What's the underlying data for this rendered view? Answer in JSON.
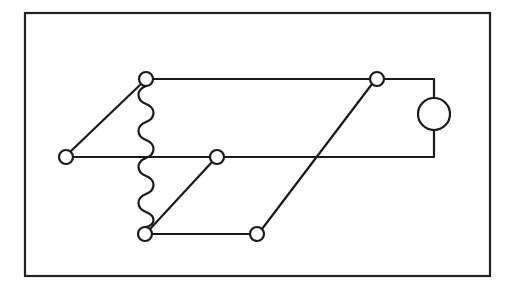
{
  "diagram": {
    "type": "circuit-schematic",
    "colors": {
      "line": "#1a1a1a",
      "background": "#ffffff"
    },
    "frame": {
      "x": 25,
      "y": 13,
      "width": 465,
      "height": 263
    },
    "nodes": [
      {
        "id": "A",
        "cx": 146,
        "cy": 79,
        "r": 7
      },
      {
        "id": "B",
        "cx": 377,
        "cy": 79,
        "r": 7
      },
      {
        "id": "C",
        "cx": 66,
        "cy": 157,
        "r": 7
      },
      {
        "id": "D",
        "cx": 217,
        "cy": 157,
        "r": 7
      },
      {
        "id": "E",
        "cx": 145,
        "cy": 234,
        "r": 7
      },
      {
        "id": "F",
        "cx": 257,
        "cy": 234,
        "r": 7
      }
    ],
    "meter": {
      "cx": 434,
      "cy": 114,
      "r": 16
    },
    "wires": [
      "M153 79 L370 79",
      "M384 79 L434 79 L434 98",
      "M434 130 L434 157 L224 157",
      "M73 157 L210 157",
      "M71 151 L141 84",
      "M150 229 L212 162",
      "M152 234 L250 234",
      "M262 229 L372 84"
    ],
    "coil": "M146 86 C 136 90, 136 100, 146 104 C 156 108, 156 118, 146 122 C 136 126, 136 136, 146 140 C 156 144, 156 154, 146 158 C 136 162, 136 172, 146 176 C 156 180, 156 190, 146 194 C 136 198, 136 208, 146 212 C 156 216, 156 224, 146 227"
  }
}
